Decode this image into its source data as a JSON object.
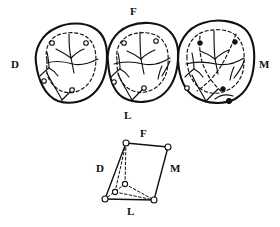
{
  "figure": {
    "kind": "molar-occlusal-tracing-diagram",
    "background_color": "#ffffff",
    "ink_color": "#111111",
    "orientation_labels": {
      "distal": "D",
      "mesial": "M",
      "facial": "F",
      "lingual": "L"
    },
    "top_panel": {
      "name": "three-molar-occlusal-tracings",
      "label_facial": "F",
      "label_lingual": "L",
      "label_distal": "D",
      "label_mesial": "M",
      "teeth": [
        {
          "name": "tooth-left",
          "cusp_marker_style": "open",
          "marker_count": 4
        },
        {
          "name": "tooth-middle",
          "cusp_marker_style": "open",
          "marker_count": 4
        },
        {
          "name": "tooth-right",
          "cusp_marker_style": "filled",
          "marker_count": 5
        }
      ]
    },
    "bottom_panel": {
      "name": "cusp-quadrilateral-diagram",
      "label_facial": "F",
      "label_lingual": "L",
      "label_distal": "D",
      "label_mesial": "M",
      "vertices": [
        {
          "name": "vertex-facial-distal",
          "x": 126,
          "y": 143,
          "style": "open"
        },
        {
          "name": "vertex-facial-mesial",
          "x": 168,
          "y": 147,
          "style": "open"
        },
        {
          "name": "vertex-lingual-mesial",
          "x": 154,
          "y": 200,
          "style": "open"
        },
        {
          "name": "vertex-lingual-distal",
          "x": 105,
          "y": 199,
          "style": "open"
        },
        {
          "name": "vertex-interior-cusp",
          "x": 115,
          "y": 192,
          "style": "open"
        },
        {
          "name": "vertex-interior-apex",
          "x": 125,
          "y": 184,
          "style": "open"
        }
      ]
    }
  }
}
